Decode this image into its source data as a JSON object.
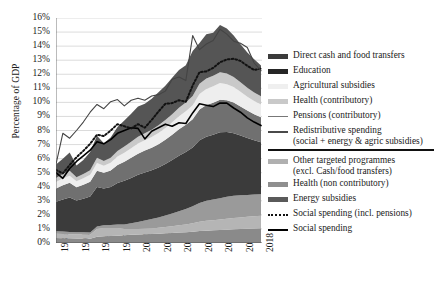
{
  "chart_data": {
    "type": "area",
    "title": "",
    "xlabel": "",
    "ylabel": "Percentage of GDP",
    "ylim": [
      0,
      16
    ],
    "yticks": [
      "0%",
      "1%",
      "2%",
      "3%",
      "4%",
      "5%",
      "6%",
      "7%",
      "8%",
      "9%",
      "10%",
      "11%",
      "12%",
      "13%",
      "14%",
      "15%",
      "16%"
    ],
    "grid": true,
    "legend_position": "right",
    "x": [
      1988,
      1989,
      1990,
      1991,
      1992,
      1993,
      1994,
      1995,
      1996,
      1997,
      1998,
      1999,
      2000,
      2001,
      2002,
      2003,
      2004,
      2005,
      2006,
      2007,
      2008,
      2009,
      2010,
      2011,
      2012,
      2013,
      2014,
      2015,
      2016,
      2017,
      2018
    ],
    "xticks": [
      "1988",
      "1991",
      "1994",
      "1997",
      "2000",
      "2003",
      "2006",
      "2009",
      "2012",
      "2015",
      "2018"
    ],
    "stack_order": [
      "Energy subsidies",
      "Health (non contributory)",
      "Other targeted programmes (excl. Cash/food transfers)",
      "Direct cash and food transfers",
      "Education",
      "Agricultural subsidies",
      "Health (contributory)",
      "Pensions (contributory)"
    ],
    "series": [
      {
        "name": "Energy subsidies",
        "kind": "area",
        "color": "#8a8a8a",
        "values": [
          0.35,
          0.34,
          0.33,
          0.32,
          0.32,
          0.31,
          0.45,
          0.48,
          0.5,
          0.52,
          0.55,
          0.58,
          0.6,
          0.62,
          0.64,
          0.66,
          0.7,
          0.72,
          0.74,
          0.76,
          0.8,
          0.85,
          0.88,
          0.9,
          0.92,
          0.95,
          0.98,
          1.0,
          1.02,
          1.04,
          1.05
        ]
      },
      {
        "name": "Health (non contributory)",
        "kind": "area",
        "color": "#b5b5b5",
        "values": [
          0.3,
          0.3,
          0.29,
          0.28,
          0.28,
          0.28,
          0.55,
          0.58,
          0.56,
          0.54,
          0.45,
          0.42,
          0.4,
          0.4,
          0.4,
          0.42,
          0.44,
          0.48,
          0.52,
          0.56,
          0.6,
          0.66,
          0.7,
          0.72,
          0.75,
          0.78,
          0.8,
          0.82,
          0.84,
          0.86,
          0.88
        ]
      },
      {
        "name": "Other targeted programmes (excl. Cash/food transfers)",
        "kind": "area",
        "color": "#9a9a9a",
        "values": [
          0.18,
          0.18,
          0.17,
          0.17,
          0.16,
          0.16,
          0.18,
          0.2,
          0.22,
          0.26,
          0.32,
          0.4,
          0.5,
          0.58,
          0.66,
          0.74,
          0.82,
          0.9,
          1.0,
          1.1,
          1.22,
          1.34,
          1.42,
          1.48,
          1.52,
          1.56,
          1.58,
          1.58,
          1.56,
          1.55,
          1.54
        ]
      },
      {
        "name": "Direct cash and food transfers",
        "kind": "area",
        "color": "#3b3b3b",
        "values": [
          2.1,
          2.28,
          2.45,
          2.25,
          2.38,
          2.55,
          2.8,
          2.62,
          2.7,
          2.95,
          3.1,
          3.22,
          3.35,
          3.42,
          3.48,
          3.55,
          3.66,
          3.8,
          3.95,
          4.05,
          4.18,
          4.45,
          4.55,
          4.6,
          4.68,
          4.6,
          4.45,
          4.25,
          4.05,
          3.85,
          3.7
        ]
      },
      {
        "name": "Education",
        "kind": "area",
        "color": "#707070",
        "values": [
          0.95,
          1.0,
          1.05,
          0.95,
          1.0,
          1.05,
          1.15,
          1.12,
          1.18,
          1.28,
          1.36,
          1.44,
          1.5,
          1.55,
          1.6,
          1.66,
          1.72,
          1.8,
          1.88,
          1.94,
          2.0,
          2.2,
          2.26,
          2.28,
          2.32,
          2.26,
          2.18,
          2.06,
          1.95,
          1.86,
          1.78
        ]
      },
      {
        "name": "Agricultural subsidies",
        "kind": "area",
        "color": "#eeeeee",
        "values": [
          0.45,
          0.48,
          0.5,
          0.42,
          0.46,
          0.5,
          0.56,
          0.5,
          0.54,
          0.6,
          0.64,
          0.68,
          0.72,
          0.74,
          0.76,
          0.8,
          0.84,
          0.88,
          0.92,
          0.96,
          1.0,
          1.1,
          1.14,
          1.16,
          1.18,
          1.14,
          1.1,
          1.04,
          0.98,
          0.94,
          0.9
        ]
      },
      {
        "name": "Health (contributory)",
        "kind": "area",
        "color": "#c9c9c9",
        "values": [
          0.3,
          0.32,
          0.34,
          0.28,
          0.3,
          0.32,
          0.38,
          0.34,
          0.36,
          0.4,
          0.44,
          0.46,
          0.48,
          0.5,
          0.52,
          0.54,
          0.56,
          0.58,
          0.6,
          0.62,
          0.66,
          0.72,
          0.74,
          0.76,
          0.78,
          0.76,
          0.72,
          0.68,
          0.64,
          0.61,
          0.58
        ]
      },
      {
        "name": "Pensions (contributory)",
        "kind": "area",
        "color": "#555555",
        "values": [
          0.95,
          1.1,
          1.3,
          0.85,
          1.0,
          1.3,
          1.55,
          1.25,
          1.45,
          1.7,
          1.85,
          2.0,
          2.15,
          2.1,
          2.2,
          2.35,
          2.45,
          2.6,
          2.7,
          2.65,
          3.2,
          2.9,
          3.15,
          3.05,
          3.35,
          3.2,
          2.95,
          2.7,
          2.5,
          2.35,
          2.2
        ]
      },
      {
        "name": "Social spending",
        "kind": "line",
        "style": "solid",
        "color": "#000000",
        "width": 1.6,
        "values": [
          5.0,
          4.6,
          5.3,
          5.8,
          6.2,
          6.6,
          7.2,
          7.05,
          7.35,
          7.8,
          8.0,
          8.2,
          8.15,
          7.4,
          7.95,
          8.2,
          8.45,
          8.3,
          8.55,
          8.5,
          9.25,
          9.9,
          9.8,
          9.7,
          9.95,
          9.95,
          9.6,
          9.3,
          8.9,
          8.6,
          8.35
        ]
      },
      {
        "name": "Social spending (incl. pensions)",
        "kind": "line",
        "style": "dotted",
        "color": "#111111",
        "width": 2,
        "values": [
          5.2,
          4.95,
          5.55,
          6.1,
          6.55,
          7.05,
          7.7,
          7.6,
          8.0,
          8.45,
          8.3,
          8.15,
          8.45,
          8.2,
          8.75,
          9.35,
          9.9,
          9.95,
          10.15,
          10.05,
          11.2,
          12.15,
          12.2,
          12.45,
          12.85,
          13.05,
          13.1,
          12.95,
          12.6,
          12.3,
          12.4
        ]
      },
      {
        "name": "Redistributive spending (social + energy & agric subsidies)",
        "kind": "line",
        "style": "solid",
        "color": "#444444",
        "width": 1.1,
        "values": [
          5.6,
          7.8,
          7.45,
          8.0,
          8.6,
          9.3,
          9.85,
          9.55,
          10.05,
          10.2,
          9.75,
          10.15,
          10.3,
          10.15,
          10.45,
          10.55,
          10.8,
          11.65,
          11.8,
          11.55,
          14.75,
          13.75,
          14.15,
          14.4,
          15.2,
          14.85,
          14.35,
          14.2,
          13.9,
          12.8,
          12.25
        ]
      }
    ],
    "legend_left": [
      {
        "label": "Direct cash and food transfers",
        "swatch": "block",
        "color": "#3b3b3b"
      },
      {
        "label": "Education",
        "swatch": "block",
        "color": "#262626"
      },
      {
        "label": "Agricultural subsidies",
        "swatch": "block",
        "color": "#efefef"
      },
      {
        "label": "Health (contributory)",
        "swatch": "block",
        "color": "#c9c9c9"
      },
      {
        "label": "Pensions (contributory)",
        "swatch": "line",
        "color": "#777777"
      },
      {
        "label": "Redistributive spending",
        "label2": "(social + energy & agric subsidies)",
        "swatch": "line2",
        "color": "#4a4a4a"
      }
    ],
    "legend_right": [
      {
        "label": "Other targeted programmes",
        "label2": "(excl. Cash/food transfers)",
        "swatch": "block",
        "color": "#b0b0b0"
      },
      {
        "label": "Health (non contributory)",
        "swatch": "block",
        "color": "#8f8f8f"
      },
      {
        "label": "Energy subsidies",
        "swatch": "block",
        "color": "#5a5a5a"
      },
      {
        "label": "Social spending (incl. pensions)",
        "swatch": "dot",
        "color": "#111111"
      },
      {
        "label": "Social spending",
        "swatch": "line2",
        "color": "#000000"
      }
    ]
  }
}
